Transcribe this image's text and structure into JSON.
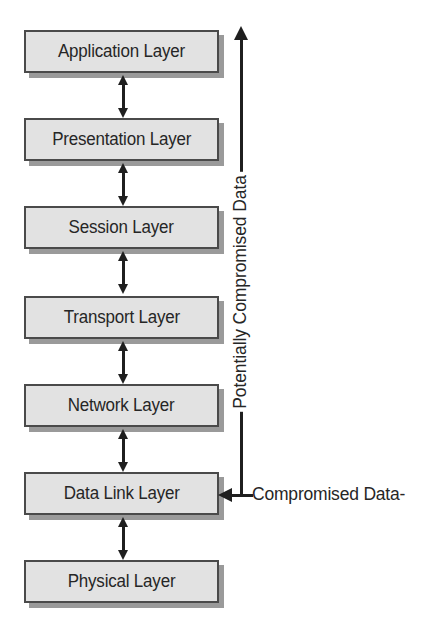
{
  "diagram": {
    "background_color": "#ffffff",
    "box_fill_color": "#e2e2e2",
    "box_border_color": "#4a4a4a",
    "box_shadow_color": "#9a9a9a",
    "arrow_color": "#1f1f1f",
    "text_color": "#262626"
  },
  "layers": [
    {
      "name": "Application Layer"
    },
    {
      "name": "Presentation Layer"
    },
    {
      "name": "Session Layer"
    },
    {
      "name": "Transport Layer"
    },
    {
      "name": "Network Layer"
    },
    {
      "name": "Data Link Layer"
    },
    {
      "name": "Physical Layer"
    }
  ],
  "annotations": {
    "potentially_compromised": {
      "label": "Potentially Compromised Data",
      "orientation": "vertical",
      "arrow_direction": "up"
    },
    "compromised": {
      "label": "Compromised Data-",
      "orientation": "horizontal",
      "arrow_direction": "left",
      "target_layer": "Data Link Layer"
    }
  },
  "connectors": [
    {
      "from": "Application Layer",
      "to": "Presentation Layer",
      "type": "double-arrow"
    },
    {
      "from": "Presentation Layer",
      "to": "Session Layer",
      "type": "double-arrow"
    },
    {
      "from": "Session Layer",
      "to": "Transport Layer",
      "type": "double-arrow"
    },
    {
      "from": "Transport Layer",
      "to": "Network Layer",
      "type": "double-arrow"
    },
    {
      "from": "Network Layer",
      "to": "Data Link Layer",
      "type": "double-arrow"
    },
    {
      "from": "Data Link Layer",
      "to": "Physical Layer",
      "type": "double-arrow"
    }
  ]
}
